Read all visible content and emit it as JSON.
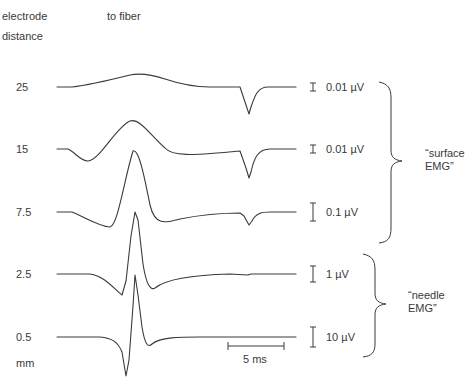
{
  "header": {
    "left_label_line1": "electrode",
    "left_label_line2": "distance",
    "top_label": "to fiber"
  },
  "units_label": "mm",
  "traces": [
    {
      "distance": "25",
      "scale": "0.01 µV"
    },
    {
      "distance": "15",
      "scale": "0.01 µV"
    },
    {
      "distance": "7.5",
      "scale": "0.1 µV"
    },
    {
      "distance": "2.5",
      "scale": "1 µV"
    },
    {
      "distance": "0.5",
      "scale": "10 µV"
    }
  ],
  "time_scale": "5 ms",
  "groups": {
    "surface": {
      "line1": "“surface",
      "line2": "EMG”"
    },
    "needle": {
      "line1": "“needle",
      "line2": "EMG”"
    }
  },
  "colors": {
    "trace": "#3a3a3a",
    "text": "#3a3a3a"
  }
}
